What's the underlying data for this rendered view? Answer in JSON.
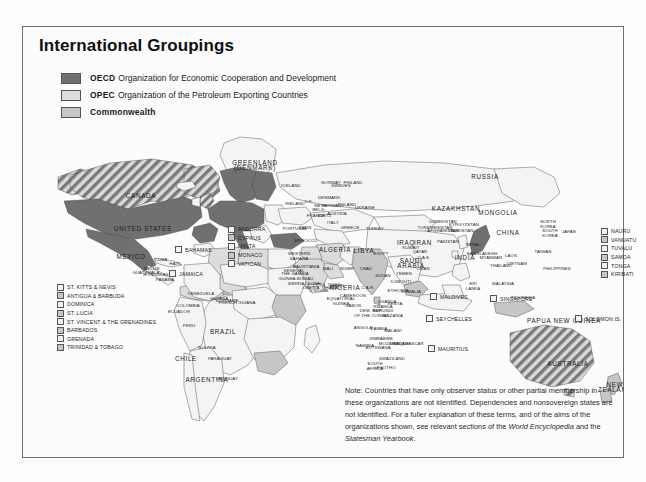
{
  "page": {
    "title": "International Groupings"
  },
  "legend": {
    "items": [
      {
        "key": "oecd",
        "abbr": "OECD",
        "text": "Organization for Economic Cooperation and Development",
        "swatch": "oecd",
        "color": "#707070"
      },
      {
        "key": "opec",
        "abbr": "OPEC",
        "text": "Organization of the Petroleum Exporting Countries",
        "swatch": "opec",
        "color": "#dcdcdc"
      },
      {
        "key": "commonwealth",
        "abbr": "Commonwealth",
        "text": "",
        "swatch": "comm",
        "color": "#c6c6c6"
      }
    ]
  },
  "note": {
    "line1": "Note: Countries that have only observer status or other partial membership in",
    "line2": "these organizations are not identified.  Dependencies and nonsovereign states",
    "line3": "are not identified.  For a fuller explanation of these terms, and of the aims of the",
    "line4_a": "organizations shown, see relevant sections of the ",
    "line4_italic": "World Encyclopedia",
    "line4_b": " and the",
    "line5_italic": "Statesman Yearbook",
    "line5_b": "."
  },
  "boxlists": {
    "caribbean": {
      "x": 34,
      "y": 256,
      "items": [
        "ST. KITTS & NEVIS",
        "ANTIGUA & BARBUDA",
        "DOMINICA",
        "ST. LUCIA",
        "ST. VINCENT & THE GRENADINES",
        "BARBADOS",
        "GRENADA",
        "TRINIDAD & TOBAGO"
      ]
    },
    "europe_micro": {
      "x": 205,
      "y": 198,
      "items": [
        "ANDORRA",
        "CYPRUS",
        "MALTA",
        "MONACO",
        "VATICAN"
      ]
    },
    "pacific": {
      "x": 578,
      "y": 200,
      "items": [
        "NAURU",
        "VANUATU",
        "TUVALU",
        "SAMOA",
        "TONGA",
        "KIRIBATI"
      ]
    }
  },
  "pins": [
    {
      "label": "BAHAMAS",
      "x": 152,
      "y": 219
    },
    {
      "label": "JAMAICA",
      "x": 146,
      "y": 243
    },
    {
      "label": "MALDIVES",
      "x": 407,
      "y": 266
    },
    {
      "label": "SEYCHELLES",
      "x": 403,
      "y": 288
    },
    {
      "label": "MAURITIUS",
      "x": 405,
      "y": 318
    },
    {
      "label": "SINGAPORE",
      "x": 467,
      "y": 268
    },
    {
      "label": "SOLOMON IS.",
      "x": 552,
      "y": 288
    }
  ],
  "map": {
    "labels_large": [
      {
        "name": "CANADA",
        "x": 118,
        "y": 171
      },
      {
        "name": "UNITED STATES",
        "x": 120,
        "y": 204
      },
      {
        "name": "MEXICO",
        "x": 108,
        "y": 232
      },
      {
        "name": "BRAZIL",
        "x": 200,
        "y": 307
      },
      {
        "name": "ARGENTINA",
        "x": 184,
        "y": 355
      },
      {
        "name": "CHILE",
        "x": 163,
        "y": 334
      },
      {
        "name": "RUSSIA",
        "x": 462,
        "y": 152
      },
      {
        "name": "CHINA",
        "x": 485,
        "y": 208
      },
      {
        "name": "INDIA",
        "x": 442,
        "y": 233
      },
      {
        "name": "AUSTRALIA",
        "x": 545,
        "y": 339
      },
      {
        "name": "MONGOLIA",
        "x": 475,
        "y": 188
      },
      {
        "name": "KAZAKHSTAN",
        "x": 433,
        "y": 184
      },
      {
        "name": "ALGERIA",
        "x": 312,
        "y": 225
      },
      {
        "name": "LIBYA",
        "x": 341,
        "y": 226
      },
      {
        "name": "SAUDI\nARABIA",
        "x": 388,
        "y": 236
      },
      {
        "name": "IRAN",
        "x": 400,
        "y": 218
      },
      {
        "name": "IRAQ",
        "x": 383,
        "y": 218
      },
      {
        "name": "NIGERIA",
        "x": 322,
        "y": 263
      },
      {
        "name": "GREENLAND\n(DENMARK)",
        "x": 232,
        "y": 138
      },
      {
        "name": "NEW\nZEALAND",
        "x": 592,
        "y": 360
      },
      {
        "name": "PAPUA NEW GUINEA",
        "x": 541,
        "y": 296
      }
    ],
    "labels_small": [
      {
        "name": "ICELAND",
        "x": 268,
        "y": 160
      },
      {
        "name": "IRELAND",
        "x": 272,
        "y": 178
      },
      {
        "name": "U.K.",
        "x": 286,
        "y": 176
      },
      {
        "name": "NORWAY",
        "x": 308,
        "y": 157
      },
      {
        "name": "SWEDEN",
        "x": 318,
        "y": 160
      },
      {
        "name": "FINLAND",
        "x": 330,
        "y": 157
      },
      {
        "name": "DENMARK",
        "x": 306,
        "y": 172
      },
      {
        "name": "NETH.",
        "x": 298,
        "y": 180
      },
      {
        "name": "BELG.",
        "x": 296,
        "y": 184
      },
      {
        "name": "GERMANY",
        "x": 310,
        "y": 180
      },
      {
        "name": "POLAND",
        "x": 324,
        "y": 179
      },
      {
        "name": "FRANCE",
        "x": 293,
        "y": 190
      },
      {
        "name": "SPAIN",
        "x": 282,
        "y": 202
      },
      {
        "name": "PORTUGAL",
        "x": 272,
        "y": 203
      },
      {
        "name": "ITALY",
        "x": 310,
        "y": 197
      },
      {
        "name": "SWITZ.",
        "x": 302,
        "y": 190
      },
      {
        "name": "AUSTRIA",
        "x": 314,
        "y": 188
      },
      {
        "name": "GREECE",
        "x": 327,
        "y": 202
      },
      {
        "name": "TURKEY",
        "x": 352,
        "y": 203
      },
      {
        "name": "UKRAINE",
        "x": 342,
        "y": 182
      },
      {
        "name": "MOROCCO",
        "x": 283,
        "y": 215
      },
      {
        "name": "WESTERN\nSAHARA",
        "x": 276,
        "y": 228
      },
      {
        "name": "MAURITANIA",
        "x": 283,
        "y": 241
      },
      {
        "name": "MALI",
        "x": 305,
        "y": 243
      },
      {
        "name": "NIGER",
        "x": 324,
        "y": 243
      },
      {
        "name": "CHAD",
        "x": 343,
        "y": 243
      },
      {
        "name": "SUDAN",
        "x": 360,
        "y": 250
      },
      {
        "name": "EGYPT",
        "x": 358,
        "y": 228
      },
      {
        "name": "ETHIOPIA",
        "x": 375,
        "y": 265
      },
      {
        "name": "KENYA",
        "x": 372,
        "y": 278
      },
      {
        "name": "TANZANIA",
        "x": 369,
        "y": 290
      },
      {
        "name": "DEM. REP.\nOF THE CONGO",
        "x": 348,
        "y": 285
      },
      {
        "name": "ANGOLA",
        "x": 340,
        "y": 302
      },
      {
        "name": "ZAMBIA",
        "x": 356,
        "y": 303
      },
      {
        "name": "NAMIBIA",
        "x": 342,
        "y": 320
      },
      {
        "name": "BOTSWANA",
        "x": 355,
        "y": 322
      },
      {
        "name": "SOUTH\nAFRICA",
        "x": 352,
        "y": 338
      },
      {
        "name": "MADAGASCAR",
        "x": 385,
        "y": 318
      },
      {
        "name": "SOMALIA",
        "x": 388,
        "y": 266
      },
      {
        "name": "VENEZUELA",
        "x": 178,
        "y": 268
      },
      {
        "name": "COLOMBIA",
        "x": 165,
        "y": 280
      },
      {
        "name": "GUYANA",
        "x": 196,
        "y": 273
      },
      {
        "name": "SURINAME",
        "x": 204,
        "y": 275
      },
      {
        "name": "FRENCH GUIANA",
        "x": 214,
        "y": 277
      },
      {
        "name": "PERU",
        "x": 166,
        "y": 300
      },
      {
        "name": "ECUADOR",
        "x": 156,
        "y": 286
      },
      {
        "name": "BOLIVIA",
        "x": 184,
        "y": 322
      },
      {
        "name": "PARAGUAY",
        "x": 197,
        "y": 333
      },
      {
        "name": "URUGUAY",
        "x": 204,
        "y": 353
      },
      {
        "name": "CUBA",
        "x": 138,
        "y": 234
      },
      {
        "name": "HAITI",
        "x": 152,
        "y": 238
      },
      {
        "name": "BELIZE",
        "x": 129,
        "y": 243
      },
      {
        "name": "GUATEMALA",
        "x": 123,
        "y": 247
      },
      {
        "name": "HONDURAS",
        "x": 133,
        "y": 249
      },
      {
        "name": "PANAMA",
        "x": 142,
        "y": 254
      },
      {
        "name": "JAPAN",
        "x": 546,
        "y": 206
      },
      {
        "name": "NORTH\nKOREA",
        "x": 525,
        "y": 196
      },
      {
        "name": "SOUTH\nKOREA",
        "x": 527,
        "y": 205
      },
      {
        "name": "TAIWAN",
        "x": 520,
        "y": 226
      },
      {
        "name": "PHILIPPINES",
        "x": 534,
        "y": 243
      },
      {
        "name": "VIETNAM",
        "x": 494,
        "y": 238
      },
      {
        "name": "THAILAND",
        "x": 478,
        "y": 240
      },
      {
        "name": "LAOS",
        "x": 488,
        "y": 230
      },
      {
        "name": "MYANMAR",
        "x": 468,
        "y": 232
      },
      {
        "name": "BANGLADESH",
        "x": 459,
        "y": 228
      },
      {
        "name": "INDONESIA",
        "x": 500,
        "y": 272
      },
      {
        "name": "MALAYSIA",
        "x": 480,
        "y": 258
      },
      {
        "name": "PAKISTAN",
        "x": 425,
        "y": 216
      },
      {
        "name": "AFGHANISTAN",
        "x": 420,
        "y": 205
      },
      {
        "name": "KYRGYZSTAN",
        "x": 441,
        "y": 199
      },
      {
        "name": "TAJIKISTAN",
        "x": 438,
        "y": 205
      },
      {
        "name": "UZBEKISTAN",
        "x": 420,
        "y": 196
      },
      {
        "name": "TURKMENISTAN",
        "x": 412,
        "y": 202
      },
      {
        "name": "U.A.E.",
        "x": 401,
        "y": 232
      },
      {
        "name": "QATAR",
        "x": 397,
        "y": 226
      },
      {
        "name": "KUWAIT",
        "x": 388,
        "y": 222
      },
      {
        "name": "YEMEN",
        "x": 381,
        "y": 248
      },
      {
        "name": "OMAN",
        "x": 400,
        "y": 243
      },
      {
        "name": "DJIBOUTI",
        "x": 378,
        "y": 256
      },
      {
        "name": "SRI\nLANKA",
        "x": 450,
        "y": 258
      },
      {
        "name": "NEPAL",
        "x": 450,
        "y": 219
      },
      {
        "name": "SIERRA LEONE",
        "x": 281,
        "y": 258
      },
      {
        "name": "LIBERIA",
        "x": 288,
        "y": 262
      },
      {
        "name": "GHANA",
        "x": 307,
        "y": 262
      },
      {
        "name": "BENIN",
        "x": 314,
        "y": 260
      },
      {
        "name": "CAMEROON",
        "x": 330,
        "y": 270
      },
      {
        "name": "GABON",
        "x": 330,
        "y": 280
      },
      {
        "name": "C.A.R.",
        "x": 345,
        "y": 262
      },
      {
        "name": "UGANDA",
        "x": 364,
        "y": 276
      },
      {
        "name": "RWANDA",
        "x": 360,
        "y": 281
      },
      {
        "name": "BURUNDI",
        "x": 360,
        "y": 285
      },
      {
        "name": "MALAWI",
        "x": 370,
        "y": 305
      },
      {
        "name": "MOZAMBIQUE",
        "x": 371,
        "y": 318
      },
      {
        "name": "ZIMBABWE",
        "x": 358,
        "y": 313
      },
      {
        "name": "SWAZILAND",
        "x": 369,
        "y": 333
      },
      {
        "name": "LESOTHO",
        "x": 362,
        "y": 342
      },
      {
        "name": "THE GAMBIA",
        "x": 272,
        "y": 248
      },
      {
        "name": "GUINEA-BISSAU",
        "x": 273,
        "y": 253
      },
      {
        "name": "SENEGAL",
        "x": 271,
        "y": 245
      },
      {
        "name": "EQUATORIAL\nGUINEA",
        "x": 318,
        "y": 273
      },
      {
        "name": "TOGO",
        "x": 311,
        "y": 259
      },
      {
        "name": "CÔTE\nD'IVOIRE",
        "x": 296,
        "y": 260
      }
    ]
  },
  "colors": {
    "oecd": "#707070",
    "opec": "#dcdcdc",
    "commonwealth": "#c6c6c6",
    "plain": "#f4f4f4",
    "outline": "#4a4a4a",
    "border": "#6e6e6e"
  }
}
